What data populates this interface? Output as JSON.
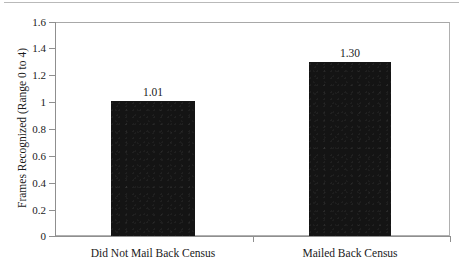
{
  "chart_data": {
    "type": "bar",
    "title": "",
    "xlabel": "",
    "ylabel": "Frames Recognized (Range 0 to 4)",
    "categories": [
      "Did Not Mail Back Census",
      "Mailed Back Census"
    ],
    "values": [
      1.01,
      1.3
    ],
    "value_labels": [
      "1.01",
      "1.30"
    ],
    "ylim": [
      0,
      1.6
    ],
    "ytick_labels": [
      "1.6",
      "1.4",
      "1.2",
      "1",
      "0.8",
      "0.6",
      "0.4",
      "0.2",
      "0"
    ],
    "ytick_values": [
      1.6,
      1.4,
      1.2,
      1.0,
      0.8,
      0.6,
      0.4,
      0.2,
      0.0
    ],
    "grid": false,
    "legend": null,
    "bar_color": "#141414",
    "frame_color": "#b0b0b0",
    "axis_color": "#8f8f8f",
    "text_color": "#1a1a1a"
  }
}
